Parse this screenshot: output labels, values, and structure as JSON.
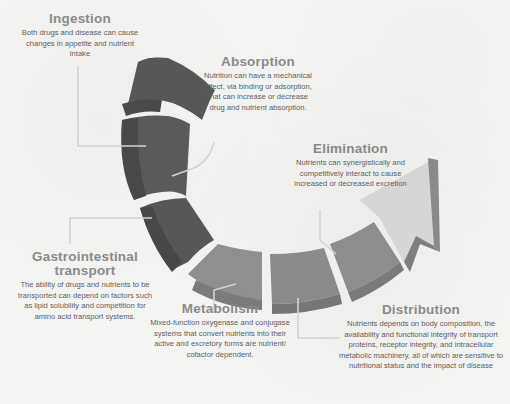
{
  "diagram": {
    "type": "curved-arrow-cycle",
    "colors": {
      "background": "#f3f3f2",
      "segment_dark": "#5a5a5a",
      "segment_dark_side": "#4a4a4a",
      "segment_mid": "#8c8c8c",
      "segment_mid_side": "#7a7a7a",
      "arrow_light": "#d6d6d6",
      "arrow_side": "#8e8e8e",
      "title_text": "#8a8a8a",
      "body_text": "#5e5e5e",
      "connector": "#d0d0d0"
    },
    "stages": [
      {
        "id": "ingestion",
        "title": "Ingestion",
        "description": "Both drugs and disease can cause changes in appetite and nutrient intake"
      },
      {
        "id": "absorption",
        "title": "Absorption",
        "description": "Nutrition can have a mechanical effect, via binding or adsorption, that can increase or decrease drug and nutrient absorption."
      },
      {
        "id": "gastrointestinal-transport",
        "title": "Gastrointestinal transport",
        "title_line1": "Gastrointestinal",
        "title_line2": "transport",
        "description": "The ability of drugs and nutrients to be transported can depend on factors such as lipid solubility and competition for amino acid transport systems."
      },
      {
        "id": "metabolism",
        "title": "Metabolism",
        "description": "Mixed-function oxygenase and conjugase systems that convert nutrients into their active and excretory forms are nutrient/ cofactor dependent."
      },
      {
        "id": "distribution",
        "title": "Distribution",
        "description": "Nutrients depends on body composition, the availability and functional integrity of transport proteins, receptor integrity, and intracellular metabolic machinery, all of which are sensitive to nutritional status and the impact of disease"
      },
      {
        "id": "elimination",
        "title": "Elimination",
        "description": "Nutrients can synergistically and competitively interact to cause increased or decreased excretion"
      }
    ]
  }
}
